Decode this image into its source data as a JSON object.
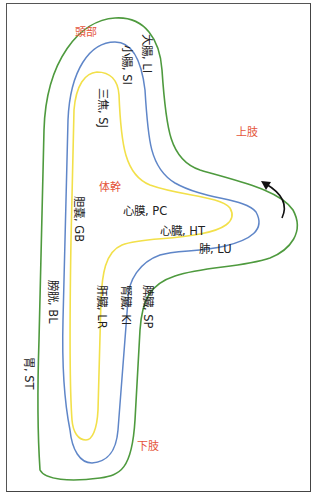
{
  "diagram": {
    "colors": {
      "outer_curve": "#4e9a3e",
      "middle_curve": "#5f86c8",
      "inner_curve": "#f2e04a",
      "region_label": "#e4553b",
      "meridian_label": "#222222",
      "arrow": "#111111"
    },
    "regions": {
      "head": "頭部",
      "upper_limb": "上肢",
      "trunk": "体幹",
      "lower_limb": "下肢"
    },
    "meridians": {
      "outer": [
        {
          "organ": "大腸",
          "code": "LI",
          "text": "大腸, LI"
        },
        {
          "organ": "肺",
          "code": "LU",
          "text": "肺, LU"
        },
        {
          "organ": "脾臓",
          "code": "SP",
          "text": "脾臓, SP"
        },
        {
          "organ": "胃",
          "code": "ST",
          "text": "胃, ST"
        }
      ],
      "middle": [
        {
          "organ": "小腸",
          "code": "SI",
          "text": "小腸, SI"
        },
        {
          "organ": "心臓",
          "code": "HT",
          "text": "心臓, HT"
        },
        {
          "organ": "腎臓",
          "code": "KI",
          "text": "腎臓, KI"
        },
        {
          "organ": "膀胱",
          "code": "BL",
          "text": "膀胱, BL"
        }
      ],
      "inner": [
        {
          "organ": "三焦",
          "code": "SJ",
          "text": "三焦, SJ"
        },
        {
          "organ": "心膜",
          "code": "PC",
          "text": "心膜, PC"
        },
        {
          "organ": "肝臓",
          "code": "LR",
          "text": "肝臓, LR"
        },
        {
          "organ": "胆嚢",
          "code": "GB",
          "text": "胆嚢, GB"
        }
      ]
    },
    "arrow": {
      "direction": "counter-clockwise",
      "icon": "curved-arrow-icon"
    }
  }
}
